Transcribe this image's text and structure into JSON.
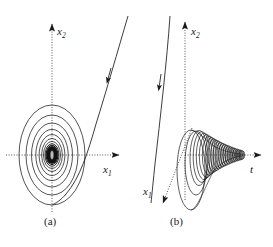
{
  "figure": {
    "background_color": "#ffffff",
    "ink_color": "#1a1a1a",
    "width": 273,
    "height": 247,
    "panels": [
      {
        "id": "a",
        "caption": "(a)",
        "description": "Phase-plane portrait: trajectory spiralling inward to a stable focus at the origin",
        "axes": [
          {
            "name": "x1",
            "label": "x",
            "subscript": "1",
            "style": "dotted",
            "direction": "right"
          },
          {
            "name": "x2",
            "label": "x",
            "subscript": "2",
            "style": "dotted",
            "direction": "up"
          }
        ],
        "origin": {
          "x": 52,
          "y": 155
        },
        "spiral": {
          "type": "inward-elliptical-spiral",
          "center": {
            "x": 52,
            "y": 155
          },
          "turns": 9,
          "outer_rx": 33,
          "outer_ry": 50,
          "decay": 0.78,
          "aspect_note": "ellipses elongated along x2"
        },
        "trajectory": {
          "type": "incoming-curve",
          "start": {
            "x": 128,
            "y": 16
          },
          "end": {
            "x": 52,
            "y": 205
          },
          "arrow_at": {
            "x": 108,
            "y": 79
          },
          "arrow_direction": "down-left"
        }
      },
      {
        "id": "b",
        "caption": "(b)",
        "description": "Time response in 3-D: damped oscillation decaying as a shrinking helix along the t axis",
        "axes": [
          {
            "name": "x1",
            "label": "x",
            "subscript": "1",
            "style": "dotted",
            "direction": "down-left"
          },
          {
            "name": "x2",
            "label": "x",
            "subscript": "2",
            "style": "dotted",
            "direction": "up"
          },
          {
            "name": "t",
            "label": "t",
            "subscript": "",
            "style": "dotted",
            "direction": "right"
          }
        ],
        "origin": {
          "x": 185,
          "y": 155
        },
        "helix": {
          "type": "decaying-helix",
          "start_x": 177,
          "end_x": 243,
          "center_y": 155,
          "start_ry": 48,
          "end_ry": 7,
          "start_rx": 9,
          "end_rx": 2.5,
          "turns": 17
        },
        "trajectory": {
          "type": "incoming-line",
          "start": {
            "x": 170,
            "y": 16
          },
          "end": {
            "x": 151,
            "y": 203
          },
          "arrow_at": {
            "x": 159,
            "y": 86
          },
          "arrow_direction": "down-left"
        }
      }
    ]
  }
}
